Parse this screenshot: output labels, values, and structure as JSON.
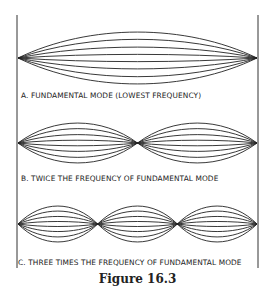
{
  "panels": [
    {
      "id": "A",
      "caption": "A. FUNDAMENTAL MODE (LOWEST FREQUENCY)",
      "loops": 1
    },
    {
      "id": "B",
      "caption": "B. TWICE THE FREQUENCY OF FUNDAMENTAL MODE",
      "loops": 2
    },
    {
      "id": "C",
      "caption": "C. THREE TIMES THE FREQUENCY OF FUNDAMENTAL MODE",
      "loops": 3
    }
  ],
  "figure_label": "Figure 16.3"
}
